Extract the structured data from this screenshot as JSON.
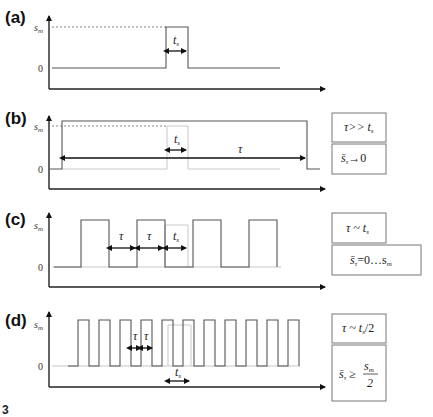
{
  "figure": {
    "number": "3",
    "y_max_label": "s_m",
    "y_max_text": "s",
    "y_max_sub": "m",
    "y_zero_label": "0"
  },
  "panels": [
    {
      "label": "(a)",
      "annotations": {
        "ts": "t",
        "ts_sub": "s"
      },
      "boxes": []
    },
    {
      "label": "(b)",
      "annotations": {
        "ts": "t",
        "ts_sub": "s",
        "tau": "τ"
      },
      "boxes": [
        {
          "text": "τ>> t",
          "sub": "s",
          "full": "τ >> t_s"
        },
        {
          "text": "s̄",
          "sub": "τ",
          "rest": "→0",
          "full": "s̄_τ → 0"
        }
      ]
    },
    {
      "label": "(c)",
      "annotations": {
        "ts": "t",
        "ts_sub": "s",
        "tau1": "τ",
        "tau2": "τ"
      },
      "boxes": [
        {
          "text": "τ ~ t",
          "sub": "s",
          "full": "τ ~ t_s"
        },
        {
          "text": "s̄",
          "sub": "τ",
          "rest": "=0…s",
          "rest_sub": "m",
          "full": "s̄_τ = 0…s_m"
        }
      ]
    },
    {
      "label": "(d)",
      "annotations": {
        "ts": "t",
        "ts_sub": "s",
        "tau1": "τ",
        "tau2": "τ"
      },
      "boxes": [
        {
          "text": "τ ~ t",
          "sub": "s",
          "rest": "/2",
          "full": "τ ~ t_s/2"
        },
        {
          "text": "s̄",
          "sub": "τ",
          "rest": " ≥ ",
          "num": "s",
          "num_sub": "m",
          "den": "2",
          "full": "s̄_τ ≥ s_m/2"
        }
      ]
    }
  ],
  "colors": {
    "axis": "#222222",
    "signal": "#555555",
    "reference_pulse": "#c8c8c8",
    "box_border": "#777777"
  }
}
